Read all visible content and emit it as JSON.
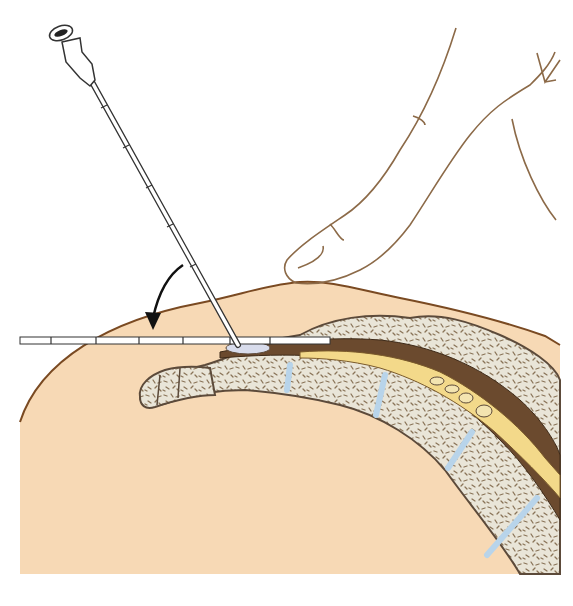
{
  "figure": {
    "elements": [
      "needle-vertical",
      "needle-horizontal",
      "rotation-arrow",
      "finger",
      "skin-surface",
      "sacrum-coccyx-section",
      "spinal-canal"
    ],
    "colors": {
      "skin": "#f7d9b5",
      "skin_outline": "#7a4a22",
      "bone": "#e9e5d8",
      "bone_outline": "#5c4a3a",
      "bone_texture": "#8a7458",
      "disc": "#b8d4ea",
      "dura": "#6b4a2e",
      "csf_sac": "#f3d98a",
      "finger_outline": "#8c6a48",
      "needle": "#ffffff",
      "needle_outline": "#333333"
    }
  }
}
